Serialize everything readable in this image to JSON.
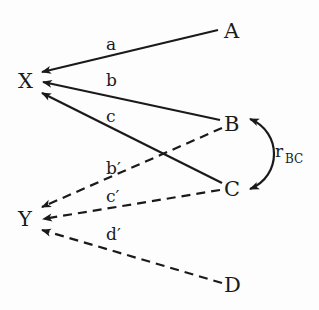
{
  "diagram": {
    "type": "path-diagram",
    "nodes": {
      "X": "X",
      "Y": "Y",
      "A": "A",
      "B": "B",
      "C": "C",
      "D": "D"
    },
    "edges": [
      {
        "from": "A",
        "to": "X",
        "label": "a",
        "style": "solid"
      },
      {
        "from": "B",
        "to": "X",
        "label": "b",
        "style": "solid"
      },
      {
        "from": "C",
        "to": "X",
        "label": "c",
        "style": "solid"
      },
      {
        "from": "B",
        "to": "Y",
        "label": "b′",
        "style": "dashed"
      },
      {
        "from": "C",
        "to": "Y",
        "label": "c′",
        "style": "dashed"
      },
      {
        "from": "D",
        "to": "Y",
        "label": "d′",
        "style": "dashed"
      }
    ],
    "correlation": {
      "between": [
        "B",
        "C"
      ],
      "label_main": "r",
      "label_sub": "BC",
      "style": "curved-double-arrow"
    },
    "labels": {
      "a": "a",
      "b": "b",
      "c": "c",
      "b_prime": "b′",
      "c_prime": "c′",
      "d_prime": "d′",
      "r": "r",
      "r_sub": "BC"
    }
  }
}
